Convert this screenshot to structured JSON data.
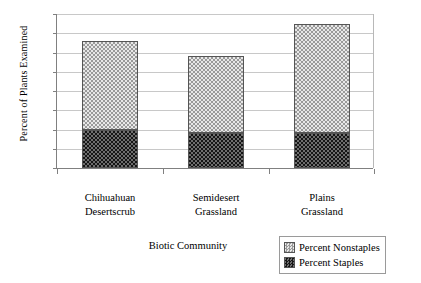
{
  "chart_data": {
    "type": "bar",
    "stacked": true,
    "title": "",
    "xlabel": "Biotic Community",
    "ylabel": "Percent of Plants Examined",
    "categories": [
      "Chihuahuan Desertscrub",
      "Semidesert Grassland",
      "Plains Grassland"
    ],
    "category_lines": [
      [
        "Chihuahuan",
        "Desertscrub"
      ],
      [
        "Semidesert",
        "Grassland"
      ],
      [
        "Plains",
        "Grassland"
      ]
    ],
    "series": [
      {
        "name": "Percent Staples",
        "values": [
          10,
          9,
          9
        ]
      },
      {
        "name": "Percent Nonstaples",
        "values": [
          23,
          20,
          28.5
        ]
      }
    ],
    "totals": [
      33,
      29,
      37.5
    ],
    "ylim": [
      0,
      40
    ],
    "ytick_values": [
      0,
      5,
      10,
      15,
      20,
      25,
      30,
      35,
      40
    ],
    "ytick_labels": [
      "0%",
      "5%",
      "10%",
      "15%",
      "20%",
      "25%",
      "30%",
      "35%",
      "40%"
    ],
    "grid": true,
    "legend_position": "bottom-right",
    "legend_entries": [
      {
        "label": "Percent Nonstaples",
        "swatch": "light-checker"
      },
      {
        "label": "Percent Staples",
        "swatch": "dark-checker"
      }
    ],
    "colors": {
      "nonstaples": "#d8d8d8",
      "staples": "#3c3c3c",
      "grid": "#c8c8c8",
      "axis": "#808080"
    }
  }
}
